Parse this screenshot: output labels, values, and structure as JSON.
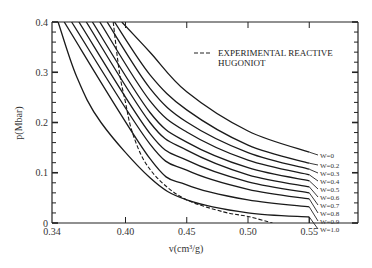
{
  "chart_data": {
    "type": "line",
    "title": "",
    "xlabel": "v(cm³/g)",
    "ylabel": "p(Mbar)",
    "xlim": [
      0.34,
      0.59
    ],
    "ylim": [
      0,
      0.4
    ],
    "x_ticks": [
      0.34,
      0.4,
      0.45,
      0.5,
      0.55
    ],
    "x_tick_labels": [
      "0.34",
      "0.40",
      "0.45",
      "0.50",
      "0.55"
    ],
    "y_ticks": [
      0,
      0.1,
      0.2,
      0.3,
      0.4
    ],
    "y_tick_labels": [
      "0",
      "0.1",
      "0.2",
      "0.3",
      "0.4"
    ],
    "grid": false,
    "legend": {
      "position": "upper right",
      "entries": [
        {
          "label_line1": "EXPERIMENTAL REACTIVE",
          "label_line2": "HUGONIOT",
          "style": "dashed"
        }
      ]
    },
    "series": [
      {
        "name": "W=0",
        "label": "W=0",
        "style": "solid",
        "points": [
          [
            0.397,
            0.4
          ],
          [
            0.42,
            0.34
          ],
          [
            0.45,
            0.261
          ],
          [
            0.5,
            0.183
          ],
          [
            0.55,
            0.141
          ]
        ]
      },
      {
        "name": "W=0.2",
        "label": "W=0.2",
        "style": "solid",
        "points": [
          [
            0.391,
            0.4
          ],
          [
            0.42,
            0.295
          ],
          [
            0.45,
            0.225
          ],
          [
            0.5,
            0.155
          ],
          [
            0.55,
            0.119
          ]
        ]
      },
      {
        "name": "W=0.3",
        "label": "W=0.3",
        "style": "solid",
        "points": [
          [
            0.385,
            0.4
          ],
          [
            0.42,
            0.268
          ],
          [
            0.45,
            0.201
          ],
          [
            0.5,
            0.14
          ],
          [
            0.55,
            0.107
          ]
        ]
      },
      {
        "name": "W=0.4",
        "label": "W=0.4",
        "style": "solid",
        "points": [
          [
            0.379,
            0.4
          ],
          [
            0.42,
            0.243
          ],
          [
            0.45,
            0.181
          ],
          [
            0.5,
            0.125
          ],
          [
            0.55,
            0.096
          ]
        ]
      },
      {
        "name": "W=0.5",
        "label": "W=0.5",
        "style": "solid",
        "points": [
          [
            0.373,
            0.4
          ],
          [
            0.42,
            0.22
          ],
          [
            0.45,
            0.161
          ],
          [
            0.5,
            0.11
          ],
          [
            0.55,
            0.084
          ]
        ]
      },
      {
        "name": "W=0.6",
        "label": "W=0.6",
        "style": "solid",
        "points": [
          [
            0.368,
            0.4
          ],
          [
            0.42,
            0.2
          ],
          [
            0.45,
            0.145
          ],
          [
            0.5,
            0.096
          ],
          [
            0.55,
            0.072
          ]
        ]
      },
      {
        "name": "W=0.7",
        "label": "W=0.7",
        "style": "solid",
        "points": [
          [
            0.362,
            0.4
          ],
          [
            0.42,
            0.178
          ],
          [
            0.45,
            0.125
          ],
          [
            0.5,
            0.082
          ],
          [
            0.55,
            0.06
          ]
        ]
      },
      {
        "name": "W=0.8",
        "label": "W=0.8",
        "style": "solid",
        "points": [
          [
            0.356,
            0.4
          ],
          [
            0.42,
            0.157
          ],
          [
            0.45,
            0.105
          ],
          [
            0.5,
            0.067
          ],
          [
            0.55,
            0.048
          ]
        ]
      },
      {
        "name": "W=0.9",
        "label": "W=0.9",
        "style": "solid",
        "points": [
          [
            0.35,
            0.4
          ],
          [
            0.42,
            0.128
          ],
          [
            0.45,
            0.076
          ],
          [
            0.5,
            0.046
          ],
          [
            0.55,
            0.032
          ]
        ]
      },
      {
        "name": "W=1.0",
        "label": "W=1.0",
        "style": "solid",
        "points": [
          [
            0.345,
            0.4
          ],
          [
            0.36,
            0.292
          ],
          [
            0.38,
            0.2
          ],
          [
            0.42,
            0.09
          ],
          [
            0.45,
            0.046
          ],
          [
            0.5,
            0.02
          ],
          [
            0.55,
            0.012
          ]
        ]
      },
      {
        "name": "Experimental reactive Hugoniot",
        "label": "",
        "style": "dashed",
        "points": [
          [
            0.39,
            0.4
          ],
          [
            0.395,
            0.3
          ],
          [
            0.4,
            0.24
          ],
          [
            0.405,
            0.185
          ],
          [
            0.415,
            0.125
          ],
          [
            0.43,
            0.08
          ],
          [
            0.45,
            0.046
          ],
          [
            0.48,
            0.022
          ],
          [
            0.5,
            0.013
          ],
          [
            0.52,
            0.0
          ]
        ]
      }
    ]
  }
}
